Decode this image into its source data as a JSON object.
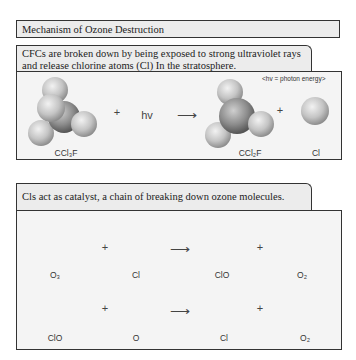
{
  "title": "Mechanism of Ozone Destruction",
  "section1": {
    "header_line1": "CFCs are broken down by being exposed to strong ultraviolet rays",
    "header_line2": "and release chlorine atoms (Cl) In the stratosphere.",
    "note": "<hv = photon energy>",
    "plus1": "+",
    "hv": "hv",
    "arrow": "⟶",
    "plus2": "+",
    "labels": {
      "reactant": "CCl₃F",
      "product1": "CCl₂F",
      "product2": "Cl"
    }
  },
  "section2": {
    "header": "Cls act as catalyst, a chain of breaking down ozone molecules.",
    "row1": {
      "plus1": "+",
      "arrow": "⟶",
      "plus2": "+",
      "labels": [
        "O₃",
        "Cl",
        "ClO",
        "O₂"
      ]
    },
    "row2": {
      "plus1": "+",
      "arrow": "⟶",
      "plus2": "+",
      "labels": [
        "ClO",
        "O",
        "Cl",
        "O₂"
      ]
    }
  },
  "colors": {
    "light_atom": "#c8c8c8",
    "dark_atom": "#8a8a8a",
    "arrow": "#8c8c8c",
    "border": "#333333"
  }
}
